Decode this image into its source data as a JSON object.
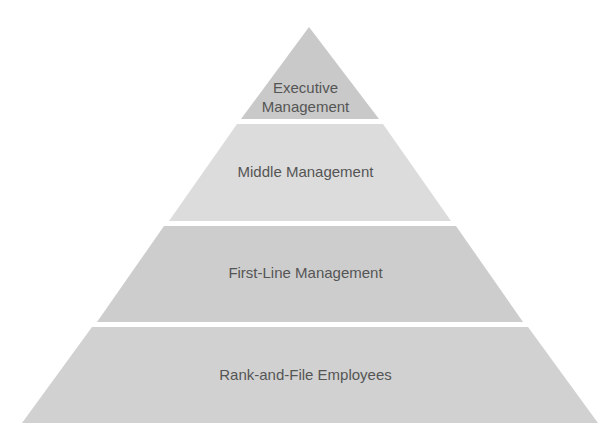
{
  "diagram": {
    "type": "pyramid",
    "title": "",
    "text_color": "#555555",
    "tiers": [
      {
        "label": "Executive\nManagement",
        "color": "#c9c9c9",
        "points": "309,27 379,119 241,119"
      },
      {
        "label": "Middle Management",
        "color": "#dcdcdc",
        "points": "237,124 383,124 451,221 169,221"
      },
      {
        "label": "First-Line Management",
        "color": "#cdcdcd",
        "points": "164,226 456,226 523,322 97,322"
      },
      {
        "label": "Rank-and-File Employees",
        "color": "#d1d1d1",
        "points": "92,327 528,327 598,423 22,423"
      }
    ]
  }
}
